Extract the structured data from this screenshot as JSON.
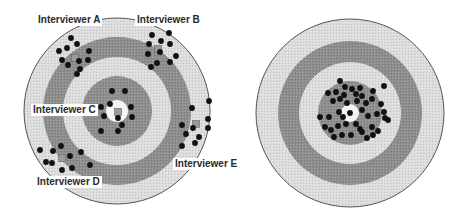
{
  "colors": {
    "background": "#ffffff",
    "ring_light": "#dadada",
    "ring_dark": "#8c8c8c",
    "ring_mid": "#e2e2e2",
    "bullseye": "#f4f4f4",
    "outline": "#555555",
    "shot": "#111111",
    "centroid": "#9a9a9a"
  },
  "targets": [
    {
      "id": "left-target",
      "description": "Interviewer bias: each interviewer's shots cluster away from bullseye",
      "cx": 117,
      "cy": 111,
      "radii": {
        "outer": 93,
        "dark_outer": 74,
        "dark_inner": 54,
        "inner_disc": 35,
        "bullseye": 11
      },
      "labels": [
        {
          "text": "Interviewer A",
          "x": 36,
          "y": 14
        },
        {
          "text": "Interviewer B",
          "x": 135,
          "y": 14
        },
        {
          "text": "Interviewer C",
          "x": 31,
          "y": 104
        },
        {
          "text": "Interviewer E",
          "x": 173,
          "y": 158
        },
        {
          "text": "Interviewer D",
          "x": 35,
          "y": 176
        }
      ],
      "centroids": [
        {
          "x": 75,
          "y": 58
        },
        {
          "x": 158,
          "y": 49
        },
        {
          "x": 118,
          "y": 112
        },
        {
          "x": 196,
          "y": 124
        },
        {
          "x": 62,
          "y": 158
        }
      ],
      "shots": [
        [
          71,
          38
        ],
        [
          77,
          44
        ],
        [
          59,
          51
        ],
        [
          67,
          48
        ],
        [
          62,
          60
        ],
        [
          89,
          51
        ],
        [
          88,
          60
        ],
        [
          68,
          65
        ],
        [
          80,
          69
        ],
        [
          77,
          74
        ],
        [
          79,
          61
        ],
        [
          152,
          35
        ],
        [
          169,
          33
        ],
        [
          161,
          41
        ],
        [
          170,
          44
        ],
        [
          149,
          44
        ],
        [
          160,
          52
        ],
        [
          176,
          56
        ],
        [
          148,
          54
        ],
        [
          157,
          63
        ],
        [
          170,
          62
        ],
        [
          151,
          67
        ],
        [
          112,
          91
        ],
        [
          125,
          91
        ],
        [
          101,
          107
        ],
        [
          110,
          104
        ],
        [
          131,
          107
        ],
        [
          104,
          116
        ],
        [
          132,
          117
        ],
        [
          118,
          118
        ],
        [
          122,
          125
        ],
        [
          101,
          131
        ],
        [
          118,
          131
        ],
        [
          209,
          101
        ],
        [
          192,
          108
        ],
        [
          208,
          119
        ],
        [
          182,
          125
        ],
        [
          193,
          128
        ],
        [
          208,
          128
        ],
        [
          186,
          134
        ],
        [
          199,
          137
        ],
        [
          195,
          143
        ],
        [
          182,
          146
        ],
        [
          40,
          150
        ],
        [
          53,
          151
        ],
        [
          61,
          146
        ],
        [
          46,
          162
        ],
        [
          52,
          163
        ],
        [
          70,
          156
        ],
        [
          81,
          152
        ],
        [
          62,
          170
        ],
        [
          72,
          168
        ],
        [
          90,
          165
        ]
      ]
    },
    {
      "id": "right-target",
      "description": "Shots tightly clustered around bullseye",
      "cx": 350,
      "cy": 113,
      "radii": {
        "outer": 94,
        "dark_outer": 72,
        "dark_inner": 51,
        "inner_disc": 32,
        "bullseye": 9
      },
      "labels": [],
      "centroids": [],
      "shots": [
        [
          340,
          81
        ],
        [
          345,
          87
        ],
        [
          352,
          89
        ],
        [
          360,
          88
        ],
        [
          336,
          92
        ],
        [
          344,
          95
        ],
        [
          356,
          94
        ],
        [
          362,
          96
        ],
        [
          373,
          91
        ],
        [
          384,
          86
        ],
        [
          328,
          93
        ],
        [
          333,
          101
        ],
        [
          340,
          99
        ],
        [
          347,
          103
        ],
        [
          357,
          101
        ],
        [
          366,
          103
        ],
        [
          372,
          99
        ],
        [
          381,
          104
        ],
        [
          384,
          112
        ],
        [
          385,
          118
        ],
        [
          320,
          117
        ],
        [
          329,
          117
        ],
        [
          339,
          112
        ],
        [
          343,
          117
        ],
        [
          350,
          113
        ],
        [
          362,
          110
        ],
        [
          368,
          116
        ],
        [
          377,
          114
        ],
        [
          388,
          120
        ],
        [
          325,
          127
        ],
        [
          331,
          130
        ],
        [
          338,
          126
        ],
        [
          346,
          124
        ],
        [
          356,
          124
        ],
        [
          360,
          129
        ],
        [
          372,
          127
        ],
        [
          378,
          131
        ],
        [
          334,
          137
        ],
        [
          342,
          135
        ],
        [
          351,
          135
        ],
        [
          362,
          132
        ],
        [
          367,
          138
        ],
        [
          373,
          135
        ]
      ]
    }
  ]
}
